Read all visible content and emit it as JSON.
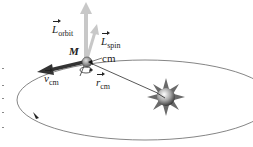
{
  "diagram": {
    "title": "",
    "labels": {
      "l_orbit": {
        "symbol": "L",
        "sub": "orbit"
      },
      "l_spin": {
        "symbol": "L",
        "sub": "spin"
      },
      "mass": "M",
      "cm": "cm",
      "v_cm": {
        "symbol": "v",
        "sub": "cm"
      },
      "r_cm": {
        "symbol": "r",
        "sub": "cm"
      }
    },
    "elements": [
      {
        "name": "orbit-ellipse",
        "type": "ellipse"
      },
      {
        "name": "orbiting-body",
        "type": "sphere",
        "label": "M"
      },
      {
        "name": "central-star",
        "type": "star"
      },
      {
        "name": "l-orbit-arrow",
        "type": "vector",
        "direction": "up"
      },
      {
        "name": "l-spin-arrow",
        "type": "vector",
        "direction": "up-right"
      },
      {
        "name": "v-cm-arrow",
        "type": "vector",
        "direction": "left"
      },
      {
        "name": "r-cm-line",
        "type": "vector",
        "direction": "body-to-star"
      },
      {
        "name": "spin-rotation-arrow",
        "type": "curved-arrow"
      },
      {
        "name": "orbit-direction-arrow",
        "type": "arrowhead"
      }
    ],
    "colors": {
      "line": "#555555",
      "vector_light": "#c8c8c8",
      "vector_dark": "#333333",
      "star": "#777777"
    }
  }
}
